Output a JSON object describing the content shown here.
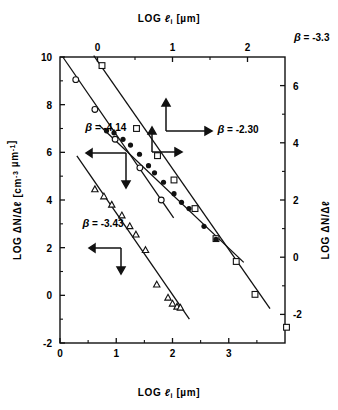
{
  "figure": {
    "top_axis_label": "LOG ℓi  [µm]",
    "bottom_axis_label": "LOG ℓi  [µm]",
    "left_axis_label": "LOG ΔN/Δℓ  [cm⁻³ µm⁻¹]",
    "right_axis_label": "LOG ΔN/Δℓ",
    "ink": "#111111",
    "background": "#ffffff"
  },
  "chart_data": {
    "type": "scatter",
    "title": "",
    "xlabel": "LOG ℓi  [µm]",
    "ylabel": "LOG ΔN/Δℓ  [cm⁻³ µm⁻¹]",
    "x2label": "LOG ℓi  [µm]",
    "y2label": "LOG ΔN/Δℓ",
    "grid": false,
    "legend": "none",
    "xlim": [
      0,
      4
    ],
    "ylim": [
      -2,
      10
    ],
    "x2lim": [
      -0.5,
      2.5
    ],
    "y2lim": [
      -3,
      7
    ],
    "xticks": [
      0,
      1,
      2,
      3
    ],
    "xticklabels": [
      "0",
      "1",
      "2",
      "3"
    ],
    "yticks": [
      -2,
      0,
      2,
      4,
      6,
      8,
      10
    ],
    "yticklabels": [
      "-2",
      "0",
      "2",
      "4",
      "6",
      "8",
      "10"
    ],
    "x2ticks": [
      0,
      1,
      2
    ],
    "x2ticklabels": [
      "0",
      "1",
      "2"
    ],
    "y2ticks": [
      -2,
      0,
      2,
      4,
      6
    ],
    "y2ticklabels": [
      "-2",
      "0",
      "2",
      "4",
      "6"
    ],
    "annotations": [
      {
        "id": "beta-414",
        "text": "β = -4.14",
        "x": 0.45,
        "y": 6.9
      },
      {
        "id": "beta-343",
        "text": "β = -3.43",
        "x": 0.4,
        "y": 2.85
      },
      {
        "id": "beta-230",
        "text": "β = -2.30",
        "x": 1.6,
        "y": 4.35
      },
      {
        "id": "beta-33",
        "text": "β = -3.3",
        "x": 2.62,
        "y": 7.55
      }
    ],
    "series": [
      {
        "name": "open-circles-upper-left",
        "marker": "open-circle",
        "axes": "bottom-left",
        "points": [
          {
            "x": 0.28,
            "y": 9.05
          },
          {
            "x": 0.62,
            "y": 7.8
          },
          {
            "x": 0.98,
            "y": 6.55
          },
          {
            "x": 1.42,
            "y": 5.35
          },
          {
            "x": 1.8,
            "y": 4.0
          }
        ],
        "fit": {
          "slope": -3.43,
          "x0": 0.05,
          "y0": 10.0,
          "x1": 2.02,
          "y1": 3.25
        }
      },
      {
        "name": "open-triangles-lower-left",
        "marker": "open-triangle",
        "axes": "bottom-left",
        "points": [
          {
            "x": 0.62,
            "y": 4.45
          },
          {
            "x": 0.78,
            "y": 4.15
          },
          {
            "x": 0.92,
            "y": 3.8
          },
          {
            "x": 1.1,
            "y": 3.35
          },
          {
            "x": 1.24,
            "y": 2.9
          },
          {
            "x": 1.35,
            "y": 2.55
          },
          {
            "x": 1.52,
            "y": 1.9
          },
          {
            "x": 1.72,
            "y": 0.45
          },
          {
            "x": 1.92,
            "y": -0.1
          },
          {
            "x": 2.0,
            "y": -0.35
          },
          {
            "x": 2.08,
            "y": -0.48
          },
          {
            "x": 2.14,
            "y": -0.52
          }
        ],
        "fit": {
          "slope": -3.43,
          "x0": 0.3,
          "y0": 5.85,
          "x1": 2.3,
          "y1": -1.0
        }
      },
      {
        "name": "open-squares-right",
        "marker": "open-square",
        "axes": "top-right",
        "points": [
          {
            "x": 0.06,
            "y": 6.7
          },
          {
            "x": 0.52,
            "y": 4.5
          },
          {
            "x": 0.8,
            "y": 3.55
          },
          {
            "x": 1.02,
            "y": 2.7
          },
          {
            "x": 1.3,
            "y": 1.7
          },
          {
            "x": 1.58,
            "y": 0.65
          },
          {
            "x": 1.85,
            "y": -0.15
          },
          {
            "x": 2.1,
            "y": -1.3
          },
          {
            "x": 2.52,
            "y": -2.45
          }
        ],
        "fit": {
          "slope": -3.3,
          "x0": -0.05,
          "y0": 7.05,
          "x1": 2.3,
          "y1": -1.8
        }
      },
      {
        "name": "filled-circles-right",
        "marker": "filled-circle",
        "axes": "top-right",
        "points": [
          {
            "x": 0.12,
            "y": 4.42
          },
          {
            "x": 0.22,
            "y": 4.35
          },
          {
            "x": 0.34,
            "y": 4.12
          },
          {
            "x": 0.44,
            "y": 3.92
          },
          {
            "x": 0.56,
            "y": 3.6
          },
          {
            "x": 0.68,
            "y": 3.2
          },
          {
            "x": 0.76,
            "y": 2.95
          },
          {
            "x": 0.88,
            "y": 2.62
          },
          {
            "x": 1.02,
            "y": 2.22
          },
          {
            "x": 1.12,
            "y": 1.92
          },
          {
            "x": 1.22,
            "y": 1.7
          },
          {
            "x": 1.42,
            "y": 1.08
          },
          {
            "x": 1.58,
            "y": 0.62
          }
        ],
        "fit": {
          "slope": -2.3,
          "x0": 0.02,
          "y0": 4.62,
          "x1": 1.95,
          "y1": -0.18
        }
      }
    ],
    "axis_pointer_arrows": [
      {
        "id": "arrow-left-upper",
        "note": "left+down pointer for beta=-4.14 curve"
      },
      {
        "id": "arrow-left-lower",
        "note": "left+down pointer for beta=-3.43 curve"
      },
      {
        "id": "arrow-right-upper",
        "note": "up+right pointer for beta=-3.3 curve"
      },
      {
        "id": "arrow-right-lower",
        "note": "up+right pointer for beta=-2.30 curve"
      }
    ]
  }
}
